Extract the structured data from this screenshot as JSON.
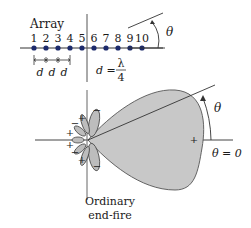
{
  "title": "Array",
  "elements": [
    "1",
    "2",
    "3",
    "4",
    "5",
    "6",
    "7",
    "8",
    "9",
    "10"
  ],
  "spacing_labels": [
    "d",
    "d",
    "d"
  ],
  "spacing_equation": {
    "lhs": "d =",
    "numerator": "λ",
    "denominator": "4"
  },
  "angle_symbol": "θ",
  "pattern": {
    "angle_label": "θ",
    "zero_label": "θ = 0",
    "main_lobe_sign": "+",
    "side_lobe_signs": [
      "−",
      "+",
      "−",
      "+",
      "+",
      "−",
      "+",
      "−"
    ],
    "caption_line1": "Ordinary",
    "caption_line2": "end-fire"
  },
  "colors": {
    "element_dot": "#1c2a6b",
    "lobe_fill": "#c8c8c8",
    "line": "#333333"
  }
}
